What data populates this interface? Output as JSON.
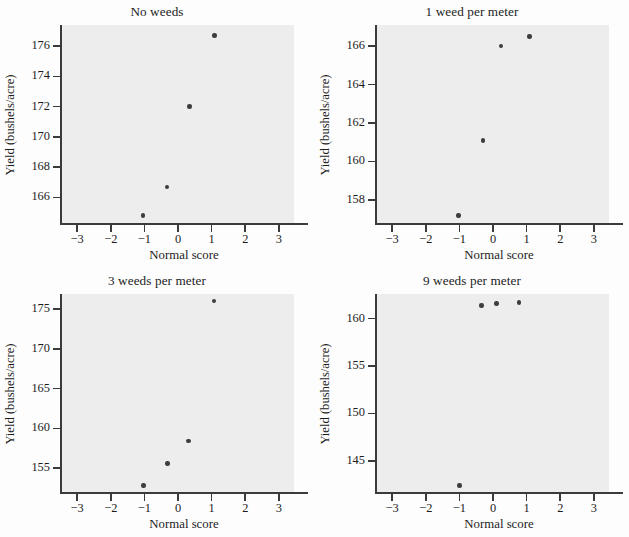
{
  "figure": {
    "background_color": "#fdfdfd",
    "panel_background_color": "#ededed",
    "axis_color": "#3b3b3b",
    "point_color": "#3d3d3d",
    "layout": "2x2 grid of normal quantile plots"
  },
  "chart_data": [
    {
      "type": "scatter",
      "title": "No weeds",
      "xlabel": "Normal score",
      "ylabel": "Yield (bushels/acre)",
      "xlim": [
        -3.45,
        3.45
      ],
      "ylim": [
        164.3,
        177.4
      ],
      "xticks": [
        -3,
        -2,
        -1,
        0,
        1,
        2,
        3
      ],
      "xticklabels": [
        "−3",
        "−2",
        "−1",
        "0",
        "1",
        "2",
        "3"
      ],
      "yticks": [
        166,
        168,
        170,
        172,
        174,
        176
      ],
      "yticklabels": [
        "166",
        "168",
        "170",
        "172",
        "174",
        "176"
      ],
      "grid": false,
      "legend": "none",
      "x": [
        -1.05,
        -0.32,
        0.34,
        1.08
      ],
      "y": [
        164.8,
        166.7,
        172.0,
        176.7
      ]
    },
    {
      "type": "scatter",
      "title": "1 weed per meter",
      "xlabel": "Normal score",
      "ylabel": "Yield (bushels/acre)",
      "xlim": [
        -3.45,
        3.45
      ],
      "ylim": [
        156.8,
        167.1
      ],
      "xticks": [
        -3,
        -2,
        -1,
        0,
        1,
        2,
        3
      ],
      "xticklabels": [
        "−3",
        "−2",
        "−1",
        "0",
        "1",
        "2",
        "3"
      ],
      "yticks": [
        158,
        160,
        162,
        164,
        166
      ],
      "yticklabels": [
        "158",
        "160",
        "162",
        "164",
        "166"
      ],
      "grid": false,
      "legend": "none",
      "x": [
        -1.03,
        -0.3,
        0.24,
        1.08
      ],
      "y": [
        157.2,
        161.1,
        166.0,
        166.5
      ]
    },
    {
      "type": "scatter",
      "title": "3 weeds per meter",
      "xlabel": "Normal score",
      "ylabel": "Yield (bushels/acre)",
      "xlim": [
        -3.45,
        3.45
      ],
      "ylim": [
        152.0,
        176.9
      ],
      "xticks": [
        -3,
        -2,
        -1,
        0,
        1,
        2,
        3
      ],
      "xticklabels": [
        "−3",
        "−2",
        "−1",
        "0",
        "1",
        "2",
        "3"
      ],
      "yticks": [
        155,
        160,
        165,
        170,
        175
      ],
      "yticklabels": [
        "155",
        "160",
        "165",
        "170",
        "175"
      ],
      "grid": false,
      "legend": "none",
      "x": [
        -1.03,
        -0.31,
        0.31,
        1.07
      ],
      "y": [
        152.8,
        155.6,
        158.4,
        176.0
      ]
    },
    {
      "type": "scatter",
      "title": "9 weeds per meter",
      "xlabel": "Normal score",
      "ylabel": "Yield (bushels/acre)",
      "xlim": [
        -3.45,
        3.45
      ],
      "ylim": [
        141.7,
        162.6
      ],
      "xticks": [
        -3,
        -2,
        -1,
        0,
        1,
        2,
        3
      ],
      "xticklabels": [
        "−3",
        "−2",
        "−1",
        "0",
        "1",
        "2",
        "3"
      ],
      "yticks": [
        145,
        150,
        155,
        160
      ],
      "yticklabels": [
        "145",
        "150",
        "155",
        "160"
      ],
      "grid": false,
      "legend": "none",
      "x": [
        -1.0,
        -0.34,
        0.1,
        0.78
      ],
      "y": [
        142.4,
        161.4,
        161.6,
        161.7
      ]
    }
  ]
}
